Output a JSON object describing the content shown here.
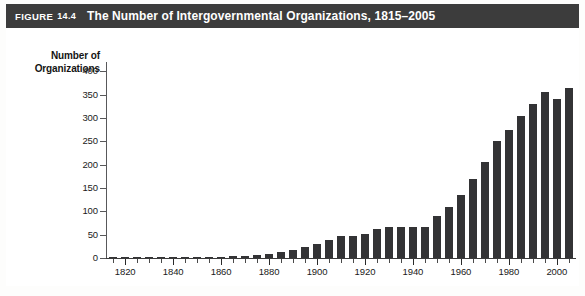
{
  "figure": {
    "label": "FIGURE",
    "number": "14.4",
    "title": "The Number of Intergovernmental Organizations, 1815–2005"
  },
  "colors": {
    "title_bar_bg": "#3c3c3c",
    "title_text": "#ffffff",
    "bar_fill": "#333335",
    "axis": "#3a3a3a",
    "plot_bg": "#ffffff",
    "frame_border": "#b8b8b4"
  },
  "chart_data": {
    "type": "bar",
    "title": "The Number of Intergovernmental Organizations, 1815–2005",
    "xlabel": "",
    "ylabel": "Number of Organizations",
    "ylim": [
      0,
      420
    ],
    "ytick_labels": [
      "0",
      "50",
      "100",
      "150",
      "200",
      "250",
      "300",
      "350",
      "400"
    ],
    "ytick_values": [
      0,
      50,
      100,
      150,
      200,
      250,
      300,
      350,
      400
    ],
    "xtick_labels": [
      "1820",
      "1840",
      "1860",
      "1880",
      "1900",
      "1920",
      "1940",
      "1960",
      "1980",
      "2000"
    ],
    "xtick_values": [
      1820,
      1840,
      1860,
      1880,
      1900,
      1920,
      1940,
      1960,
      1980,
      2000
    ],
    "xlim": [
      1812,
      2008
    ],
    "grid": false,
    "legend": null,
    "categories": [
      1815,
      1820,
      1825,
      1830,
      1835,
      1840,
      1845,
      1850,
      1855,
      1860,
      1865,
      1870,
      1875,
      1880,
      1885,
      1890,
      1895,
      1900,
      1905,
      1910,
      1915,
      1920,
      1925,
      1930,
      1935,
      1940,
      1945,
      1950,
      1955,
      1960,
      1965,
      1970,
      1975,
      1980,
      1985,
      1990,
      1995,
      2000,
      2005
    ],
    "values": [
      1,
      1,
      1,
      1,
      2,
      2,
      2,
      2,
      3,
      3,
      4,
      5,
      7,
      9,
      12,
      17,
      23,
      30,
      38,
      47,
      47,
      52,
      62,
      66,
      66,
      66,
      67,
      90,
      110,
      135,
      170,
      205,
      250,
      275,
      305,
      330,
      355,
      340,
      365
    ],
    "ylabel_line1": "Number of",
    "ylabel_line2": "Organizations"
  },
  "axis_geometry": {
    "x_left_px": 100,
    "x_right_px": 570,
    "y_zero_px": 230,
    "y_top_px": 34,
    "bar_width_px": 8,
    "note": "layout hints only"
  }
}
